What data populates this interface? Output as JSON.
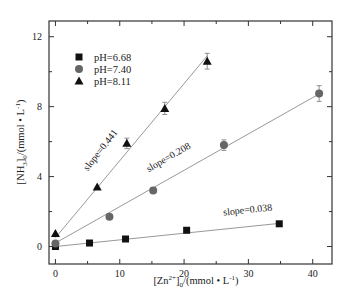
{
  "chart_data": {
    "type": "scatter",
    "title": "",
    "xlabel": "[Zn2+]0/(mmol • L-1)",
    "ylabel": "[NH3]0/(mmol • L-1)",
    "xlim": [
      -1,
      43
    ],
    "ylim": [
      -1,
      12.9
    ],
    "x_ticks": [
      0,
      10,
      20,
      30,
      40
    ],
    "y_ticks": [
      0,
      4,
      8,
      12
    ],
    "x_minor_step": 5,
    "y_minor_step": 2,
    "grid": false,
    "legend_position": "upper-left",
    "series": [
      {
        "name": "pH=6.68",
        "marker": "square",
        "color": "#111111",
        "x": [
          0,
          5.3,
          10.9,
          20.4,
          34.8
        ],
        "y": [
          0.0,
          0.2,
          0.43,
          0.93,
          1.3
        ],
        "errors": [
          0,
          0,
          0,
          0,
          0
        ],
        "fit": {
          "slope": 0.038,
          "intercept": 0.0,
          "x_range": [
            0,
            34.8
          ]
        },
        "slope_label": "slope=0.038"
      },
      {
        "name": "pH=7.40",
        "marker": "circle",
        "color": "#666666",
        "x": [
          0,
          8.4,
          15.2,
          26.2,
          41
        ],
        "y": [
          0.17,
          1.7,
          3.2,
          5.8,
          8.75
        ],
        "errors": [
          0,
          0,
          0,
          0.3,
          0.45
        ],
        "fit": {
          "slope": 0.208,
          "intercept": 0.2,
          "x_range": [
            0,
            41
          ]
        },
        "slope_label": "slope=0.208"
      },
      {
        "name": "pH=8.11",
        "marker": "triangle",
        "color": "#111111",
        "x": [
          0,
          6.5,
          11.1,
          17.0,
          23.6
        ],
        "y": [
          0.74,
          3.4,
          5.9,
          7.9,
          10.6
        ],
        "errors": [
          0,
          0,
          0.3,
          0.35,
          0.45
        ],
        "fit": {
          "slope": 0.441,
          "intercept": 0.5,
          "x_range": [
            0,
            23.6
          ]
        },
        "slope_label": "slope=0.441"
      }
    ]
  },
  "labels": {
    "x_main": "[Zn",
    "x_sup": "2+",
    "x_close": "]",
    "x_sub": "0",
    "x_units": "/(mmol • L",
    "x_units_sup": "-1",
    "x_units_close": ")",
    "y_main": "[NH",
    "y_sub3": "3",
    "y_close": "]",
    "y_sub": "0",
    "y_units": "/(mmol • L",
    "y_units_sup": "-1",
    "y_units_close": ")"
  }
}
